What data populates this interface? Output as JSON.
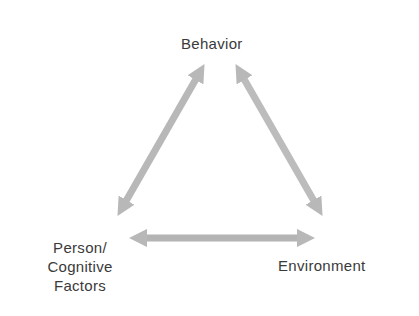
{
  "diagram": {
    "title": "",
    "nodes": {
      "behavior": "Behavior",
      "person_line1": "Person/",
      "person_line2": "Cognitive",
      "person_line3": "Factors",
      "environment": "Environment"
    },
    "edges": [
      {
        "from": "Behavior",
        "to": "Person/Cognitive Factors",
        "type": "bidirectional"
      },
      {
        "from": "Behavior",
        "to": "Environment",
        "type": "bidirectional"
      },
      {
        "from": "Person/Cognitive Factors",
        "to": "Environment",
        "type": "bidirectional"
      }
    ],
    "colors": {
      "arrow": "#b8b8b8",
      "text": "#3a3a3a",
      "background": "#ffffff"
    }
  }
}
